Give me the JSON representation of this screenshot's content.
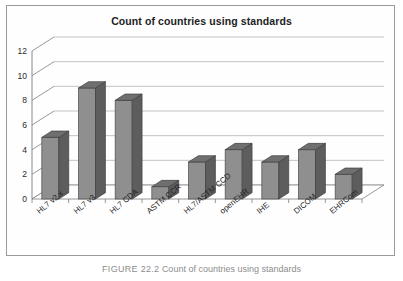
{
  "figure": {
    "caption_label": "FIGURE 22.2",
    "caption_text": "Count of countries using standards"
  },
  "chart_data": {
    "type": "bar",
    "title": "Count of countries using standards",
    "xlabel": "",
    "ylabel": "",
    "ylim": [
      0,
      12
    ],
    "ytick_values": [
      0,
      2,
      4,
      6,
      8,
      10,
      12
    ],
    "grid": true,
    "legend": "none",
    "style": "3d-column",
    "categories": [
      "HL7 v2.x",
      "HL7 v3",
      "HL7 CDA",
      "ASTM CCR",
      "HL7/ASTM CCD",
      "openEHR",
      "IHE",
      "DICOM",
      "EHRCom"
    ],
    "values": [
      5,
      9,
      8,
      1,
      3,
      4,
      3,
      4,
      2
    ],
    "colors": {
      "bar_front": "#8f8f8f",
      "bar_side": "#5d5d5d",
      "bar_top": "#6f6f6f",
      "gridline": "#b4b4b4",
      "axis": "#7d7d7d",
      "frame": "#9a9a9a",
      "text": "#1d1d1d"
    }
  }
}
